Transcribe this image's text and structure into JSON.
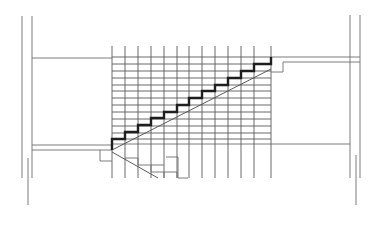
{
  "diagram": {
    "title": "",
    "type": "staircase-section-drawing",
    "colors": {
      "background": "#ffffff",
      "thin_line": "#6e6e6e",
      "grid_line": "#5a5a5a",
      "stair_profile": "#1e1e1e"
    },
    "walls": {
      "left": [
        {
          "x1": 22,
          "y1": 16,
          "x2": 22,
          "y2": 178
        },
        {
          "x1": 32,
          "y1": 16,
          "x2": 32,
          "y2": 178
        },
        {
          "x1": 28,
          "y1": 158,
          "x2": 28,
          "y2": 205
        }
      ],
      "right": [
        {
          "x1": 350,
          "y1": 15,
          "x2": 350,
          "y2": 178
        },
        {
          "x1": 360,
          "y1": 15,
          "x2": 360,
          "y2": 178
        },
        {
          "x1": 356,
          "y1": 155,
          "x2": 356,
          "y2": 205
        }
      ]
    },
    "floor_lines": [
      {
        "x1": 32,
        "y1": 58,
        "x2": 112,
        "y2": 58
      },
      {
        "x1": 271,
        "y1": 57,
        "x2": 360,
        "y2": 57
      },
      {
        "x1": 283,
        "y1": 62,
        "x2": 360,
        "y2": 62
      },
      {
        "x1": 32,
        "y1": 145,
        "x2": 112,
        "y2": 145
      },
      {
        "x1": 32,
        "y1": 150,
        "x2": 112,
        "y2": 150
      },
      {
        "x1": 112,
        "y1": 144,
        "x2": 350,
        "y2": 144
      }
    ],
    "grid": {
      "x_lines": [
        112,
        125,
        138,
        151,
        164,
        177,
        189,
        202,
        215,
        228,
        241,
        254,
        271
      ],
      "x_top": 46,
      "x_bottom": 178,
      "y_lines": [
        57,
        64,
        71,
        78,
        85,
        91,
        98,
        105,
        112,
        119,
        126,
        133,
        139
      ],
      "y_left": 112,
      "y_right": 271
    },
    "stair_profile": {
      "points": "112,150 112,139 125,139 125,132 138,132 138,125 151,125 151,118 164,118 164,112 177,112 177,105 189,105 189,98 202,98 202,91 215,91 215,85 228,85 228,78 241,78 241,71 254,71 254,64 271,64 271,57"
    },
    "diagonals": [
      {
        "x1": 112,
        "y1": 150,
        "x2": 271,
        "y2": 69
      },
      {
        "x1": 112,
        "y1": 152,
        "x2": 158,
        "y2": 178
      }
    ],
    "small_steps": [
      "100,150 100,161 112,161",
      "271,72 283,72 283,62",
      "125,158 138,158 138,165 151,165 151,172 164,172 164,178"
    ],
    "underside_boxes": [
      "151,165 164,165",
      "164,172 177,172 177,178",
      "166,157 178,157 178,178 188,178"
    ]
  }
}
